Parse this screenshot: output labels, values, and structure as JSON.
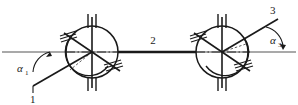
{
  "figure": {
    "type": "mechanical-schematic",
    "background_color": "#ffffff",
    "line_color": "#1a1a1a",
    "axis_color": "#808080",
    "canvas": {
      "width": 298,
      "height": 105
    }
  },
  "labels": {
    "input_shaft": "1",
    "intermediate_shaft": "2",
    "output_shaft": "3",
    "angle_left_symbol": "α",
    "angle_left_subscript": "1",
    "angle_right_symbol": "α",
    "angle_right_subscript": "3"
  },
  "geometry": {
    "axis_y": 52,
    "axis_x_start": 2,
    "axis_x_end": 296,
    "left_joint_center": {
      "x": 92,
      "y": 52
    },
    "right_joint_center": {
      "x": 222,
      "y": 52
    },
    "joint_radius": 26,
    "intermediate_shaft": {
      "x1": 118,
      "y1": 52,
      "x2": 196,
      "y2": 52
    },
    "input_shaft_line": {
      "x1": 92,
      "y1": 52,
      "x2": 33,
      "y2": 86
    },
    "output_shaft_line": {
      "x1": 222,
      "y1": 52,
      "x2": 278,
      "y2": 19
    },
    "angle_left_vertex": {
      "x": 28,
      "y": 52
    },
    "angle_right_vertex": {
      "x": 283,
      "y": 52
    }
  }
}
